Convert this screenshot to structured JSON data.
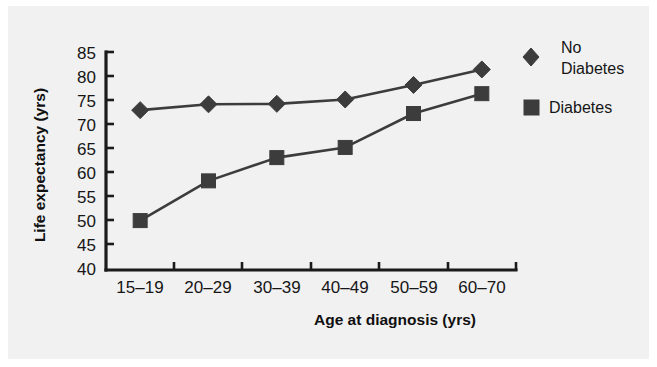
{
  "figure": {
    "background_color": "#f1f1f1",
    "page_color": "#ffffff",
    "ink_color": "#3c3c3c"
  },
  "chart_data": {
    "type": "line",
    "title": "",
    "xlabel": "Age at diagnosis (yrs)",
    "ylabel": "Life expectancy (yrs)",
    "categories": [
      "15–19",
      "20–29",
      "30–39",
      "40–49",
      "50–59",
      "60–70"
    ],
    "yticks": [
      40,
      45,
      50,
      55,
      60,
      65,
      70,
      75,
      80,
      85
    ],
    "ylim": [
      40,
      85
    ],
    "grid": false,
    "legend_position": "right",
    "series": [
      {
        "name": "No Diabetes",
        "marker": "diamond",
        "color": "#3c3c3c",
        "values": [
          73.0,
          74.2,
          74.3,
          75.2,
          78.2,
          81.4
        ]
      },
      {
        "name": "Diabetes",
        "marker": "square",
        "color": "#3c3c3c",
        "values": [
          50.2,
          58.4,
          63.2,
          65.3,
          72.3,
          76.4
        ]
      }
    ]
  },
  "legend": {
    "items": [
      {
        "label_line1": "No",
        "label_line2": "Diabetes",
        "marker": "diamond"
      },
      {
        "label_line1": "Diabetes",
        "label_line2": "",
        "marker": "square"
      }
    ]
  }
}
